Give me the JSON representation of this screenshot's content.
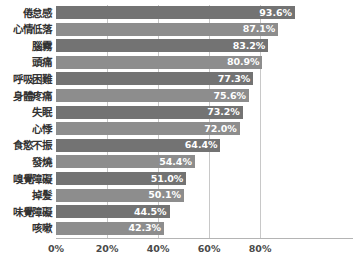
{
  "chart_data": {
    "type": "bar",
    "orientation": "horizontal",
    "title": "",
    "subtitle": "",
    "xlabel": "",
    "ylabel": "",
    "xlim": [
      0,
      116
    ],
    "grid": true,
    "legend": null,
    "xticks": [
      "0%",
      "20%",
      "40%",
      "60%",
      "80%"
    ],
    "xtick_values": [
      0,
      20,
      40,
      60,
      80
    ],
    "categories": [
      "倦怠感",
      "心情低落",
      "腦霧",
      "頭痛",
      "呼吸困難",
      "身體疼痛",
      "失眠",
      "心悸",
      "食慾不振",
      "發燒",
      "嗅覺障礙",
      "掉髮",
      "味覺障礙",
      "咳嗽"
    ],
    "values": [
      93.6,
      87.1,
      83.2,
      80.9,
      77.3,
      75.6,
      73.2,
      72.0,
      64.4,
      54.4,
      51.0,
      50.1,
      44.5,
      42.3
    ],
    "value_labels": [
      "93.6%",
      "87.1%",
      "83.2%",
      "80.9%",
      "77.3%",
      "75.6%",
      "73.2%",
      "72.0%",
      "64.4%",
      "54.4%",
      "51.0%",
      "50.1%",
      "44.5%",
      "42.3%"
    ],
    "colors": {
      "bar_light": "#8d8d8d",
      "bar_dark": "#737373",
      "gridline": "#c8c8c8",
      "value_text": "#ffffff",
      "category_text": "#333333",
      "background": "#ffffff"
    }
  }
}
